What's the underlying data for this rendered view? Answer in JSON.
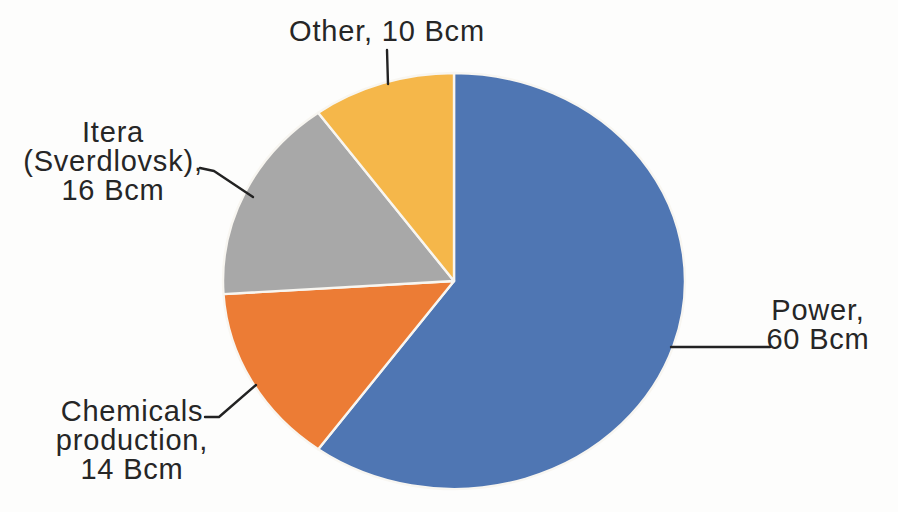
{
  "figure": {
    "background_color": "#fdfdfc",
    "text_color": "#262626",
    "leader_line_color": "#222222",
    "slice_border_color": "#f8f6f1"
  },
  "chart_data": {
    "type": "pie",
    "title": "",
    "unit": "Bcm",
    "total": 100,
    "start_angle_deg": 0,
    "direction": "clockwise",
    "legend": "none",
    "labels_position": "outside-with-leader-lines",
    "categories": [
      "Power",
      "Chemicals production",
      "Itera (Sverdlovsk)",
      "Other"
    ],
    "values": [
      60,
      14,
      16,
      10
    ],
    "slices": [
      {
        "name": "Power",
        "value": 60,
        "color": "#4f76b3",
        "label": "Power,\n60 Bcm"
      },
      {
        "name": "Chemicals production",
        "value": 14,
        "color": "#ec7c35",
        "label": "Chemicals\nproduction,\n14 Bcm"
      },
      {
        "name": "Itera (Sverdlovsk)",
        "value": 16,
        "color": "#a8a8a8",
        "label": "Itera\n(Sverdlovsk),\n16 Bcm"
      },
      {
        "name": "Other",
        "value": 10,
        "color": "#f5b74a",
        "label": "Other, 10 Bcm"
      }
    ]
  }
}
